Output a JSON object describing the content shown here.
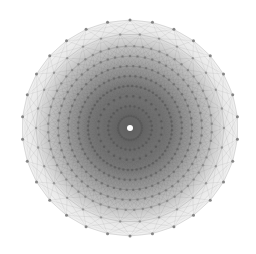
{
  "diagram": {
    "type": "radial-polytope-projection",
    "center": {
      "x": 130,
      "y": 128
    },
    "outer_radius": 108,
    "outer_vertex_count": 30,
    "rings": [
      {
        "r": 108,
        "n": 30,
        "offset_half": true,
        "dot_color": "#7a7a7a"
      },
      {
        "r": 94,
        "n": 30,
        "offset_half": false,
        "dot_color": "#808080"
      },
      {
        "r": 82,
        "n": 60,
        "offset_half": true,
        "dot_color": "#7a7a7a"
      },
      {
        "r": 72,
        "n": 60,
        "offset_half": false,
        "dot_color": "#707070"
      },
      {
        "r": 62,
        "n": 60,
        "offset_half": true,
        "dot_color": "#686868"
      },
      {
        "r": 52,
        "n": 60,
        "offset_half": false,
        "dot_color": "#606060"
      },
      {
        "r": 42,
        "n": 60,
        "offset_half": true,
        "dot_color": "#585858"
      },
      {
        "r": 32,
        "n": 30,
        "offset_half": false,
        "dot_color": "#555555"
      },
      {
        "r": 22,
        "n": 30,
        "offset_half": true,
        "dot_color": "#555555"
      },
      {
        "r": 12,
        "n": 30,
        "offset_half": false,
        "dot_color": "#555555"
      }
    ],
    "colors": {
      "background": "#ffffff",
      "edge": "#555555",
      "outer_fill": "#f2f2f2",
      "inner_fill": "#6a6a6a",
      "center_highlight": "#ffffff"
    }
  }
}
